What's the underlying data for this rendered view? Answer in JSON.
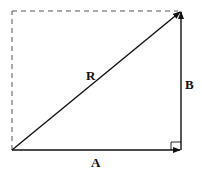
{
  "diagram": {
    "title": "",
    "type": "vector-addition",
    "colors": {
      "stroke": "#111111",
      "dashed": "#555555",
      "background": "#ffffff"
    },
    "vectors": [
      {
        "name": "A",
        "label": "A",
        "from": [
          12,
          150
        ],
        "to": [
          181,
          150
        ]
      },
      {
        "name": "B",
        "label": "B",
        "from": [
          181,
          150
        ],
        "to": [
          181,
          11
        ]
      },
      {
        "name": "R",
        "label": "R",
        "from": [
          12,
          150
        ],
        "to": [
          181,
          11
        ]
      }
    ],
    "labels": {
      "A": "A",
      "B": "B",
      "R": "R"
    },
    "guides": {
      "dashed_left": "dashed vertical",
      "dashed_top": "dashed horizontal"
    },
    "right_angle_marker": true
  }
}
